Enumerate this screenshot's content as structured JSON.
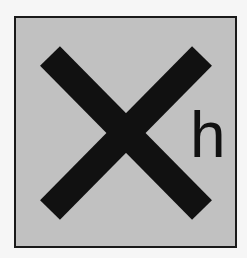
{
  "symbol": {
    "name": "harmful",
    "code": "h",
    "glyph": "cross-icon",
    "colors": {
      "background": "#c1c1c1",
      "mark": "#111111",
      "border": "#1a1a1a"
    }
  }
}
